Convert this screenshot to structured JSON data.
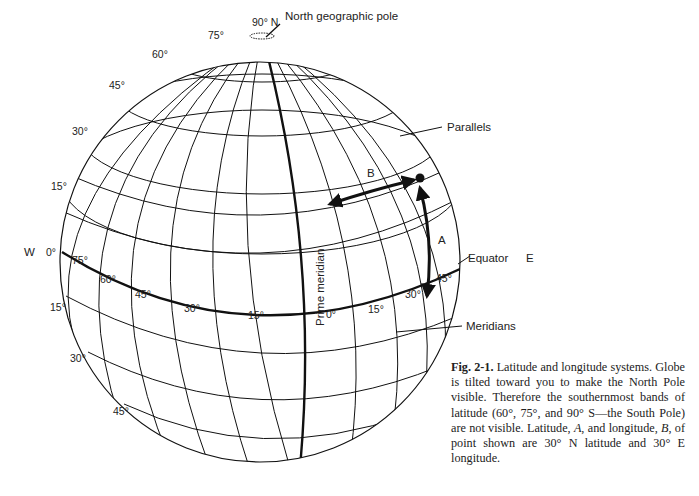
{
  "figure": {
    "type": "globe-diagram",
    "title": "Latitude and longitude systems"
  },
  "labels": {
    "north_pole": "North geographic pole",
    "pole_deg": "90° N",
    "parallels": "Parallels",
    "meridians": "Meridians",
    "equator": "Equator",
    "prime_meridian": "Prime meridian",
    "west": "W",
    "east": "E",
    "arrow_a": "A",
    "arrow_b": "B"
  },
  "latitude_labels_left": [
    "75°",
    "60°",
    "45°",
    "30°",
    "15°",
    "0°",
    "15°",
    "30°",
    "45°"
  ],
  "longitude_labels_equator": [
    "75°",
    "60°",
    "45°",
    "30°",
    "15°",
    "0°",
    "15°",
    "30°",
    "45°"
  ],
  "caption": {
    "fig_num": "Fig. 2-1.",
    "text_1": " Latitude and longitude systems. Globe is tilted toward you to make the North Pole visible. Therefore the southernmost bands of latitude (60°, 75°, and 90° S—the South Pole) are not visible. Latitude, ",
    "a": "A",
    "text_2": ", and longitude, ",
    "b": "B",
    "text_3": ", of point shown are 30° N latitude and 30° E longitude."
  }
}
